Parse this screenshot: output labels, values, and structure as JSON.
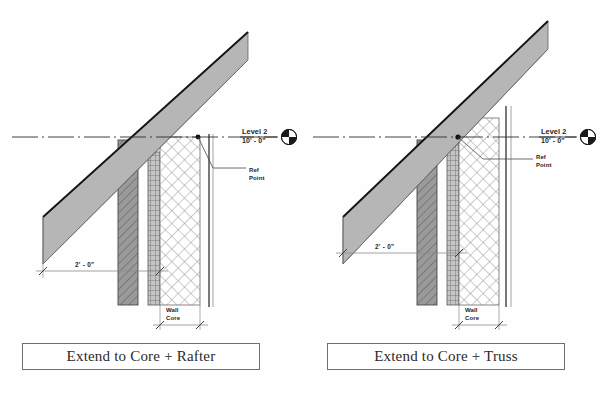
{
  "page": {
    "background_color": "#fefefe",
    "width": 609,
    "height": 393
  },
  "panels": [
    {
      "id": "left",
      "caption": "Extend to Core + Rafter",
      "level_label": "Level 2",
      "elevation_label": "10' - 0\"",
      "ref_point_label_line1": "Ref",
      "ref_point_label_line2": "Point",
      "overhang_dimension": "2' - 0\"",
      "core_label_line1": "Wall",
      "core_label_line2": "Core",
      "level_head_icon": "level-head-circle-icon",
      "description": "Rafter extends through finish layers to far face of wall core; reference point at inner face of exterior finish"
    },
    {
      "id": "right",
      "caption": "Extend to Core + Truss",
      "level_label": "Level 2",
      "elevation_label": "10' - 0\"",
      "ref_point_label_line1": "Ref",
      "ref_point_label_line2": "Point",
      "overhang_dimension": "2' - 0\"",
      "core_label_line1": "Wall",
      "core_label_line2": "Core",
      "level_head_icon": "level-head-circle-icon",
      "description": "Truss bearing stops at near face of wall core; reference point at exterior face of core"
    }
  ],
  "colors": {
    "rafter_fill": "#b6b6b6",
    "rafter_edge": "#1a1a1a",
    "stud_fill": "#8f8f8f",
    "sheathing_fill": "#c9c9c9",
    "core_fill": "#ffffff",
    "hatch_line": "#7a7a7a",
    "dimension_line": "#8a8a8a",
    "text": "#1d1d1d",
    "caption_border": "#6f6f6f"
  },
  "legend_note": "Architectural wall-section comparison of roof framing attachment options"
}
